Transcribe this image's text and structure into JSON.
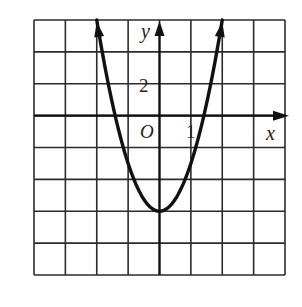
{
  "chart_data": {
    "type": "line",
    "title": "",
    "function": "y = 3x^2 - 6",
    "xlabel": "x",
    "ylabel": "y",
    "origin_label": "O",
    "tick_labels": {
      "x": [
        "1"
      ],
      "y": [
        "2"
      ]
    },
    "x_unit_per_cell": 1,
    "y_unit_per_cell": 2,
    "xlim": [
      -4,
      4
    ],
    "ylim": [
      -10,
      6
    ],
    "grid": true,
    "grid_cells": {
      "cols": 8,
      "rows": 8
    },
    "series": [
      {
        "name": "parabola",
        "x": [
          -2,
          -1.5,
          -1,
          -0.5,
          0,
          0.5,
          1,
          1.5,
          2
        ],
        "y": [
          6,
          0.75,
          -3,
          -5.25,
          -6,
          -5.25,
          -3,
          0.75,
          6
        ]
      }
    ],
    "vertex": [
      0,
      -6
    ],
    "x_intercepts": [
      -1.41,
      1.41
    ],
    "colors": {
      "grid": "#2b2b2b",
      "curve": "#111111",
      "background": "#ffffff"
    }
  }
}
